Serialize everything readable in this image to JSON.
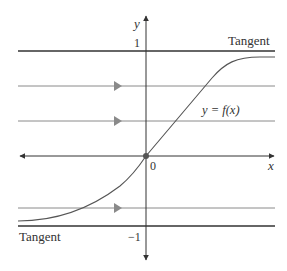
{
  "diagram": {
    "title": "",
    "axes": {
      "x_label": "x",
      "y_label": "y",
      "origin_label": "0",
      "y_tick_top": "1",
      "y_tick_bottom": "−1"
    },
    "curve_label": "y = f(x)",
    "tangent_top_label": "Tangent",
    "tangent_bottom_label": "Tangent",
    "colors": {
      "axis": "#333333",
      "tangent": "#333333",
      "horizontal_lines": "#8a8a8a",
      "arrows": "#8a8a8a",
      "curve": "#555555",
      "origin_dot": "#555555"
    },
    "horizontal_lines_with_arrows": [
      {
        "y_value": 0.5,
        "has_arrow": true
      },
      {
        "y_value": 0.25,
        "has_arrow": true
      },
      {
        "y_value": -0.75,
        "has_arrow": true
      }
    ],
    "asymptotes": [
      {
        "y_value": 1,
        "label": "Tangent"
      },
      {
        "y_value": -1,
        "label": "Tangent"
      }
    ]
  }
}
